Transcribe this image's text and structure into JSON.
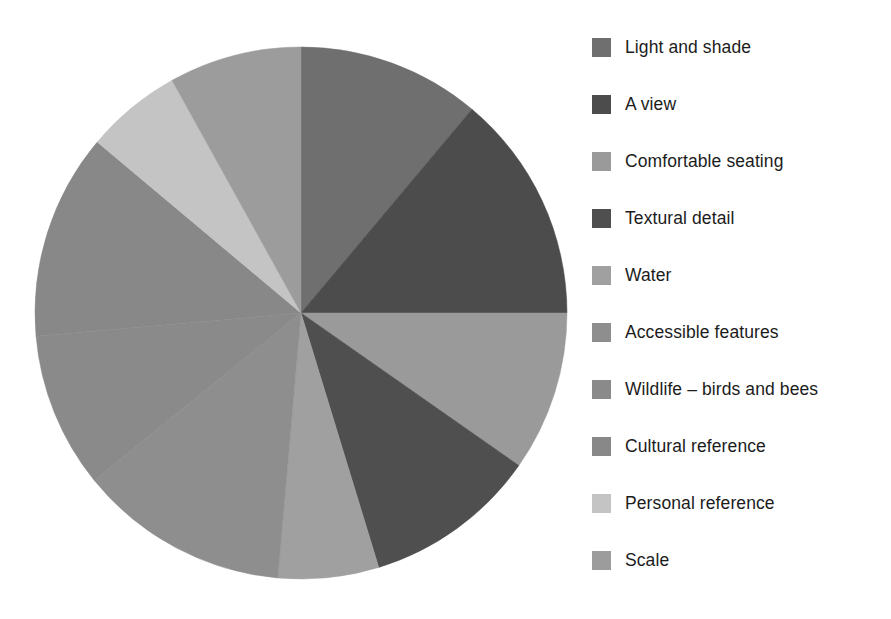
{
  "chart_data": {
    "type": "pie",
    "title": "",
    "subtitle": "",
    "xlabel": "",
    "ylabel": "",
    "legend_position": "right",
    "grid": false,
    "start_angle_deg": 0,
    "direction": "clockwise",
    "categories": [
      "Light and shade",
      "A view",
      "Comfortable seating",
      "Textural detail",
      "Water",
      "Accessible features",
      "Wildlife – birds and bees",
      "Cultural reference",
      "Personal reference",
      "Scale"
    ],
    "values": [
      11.1,
      13.9,
      9.7,
      10.6,
      6.1,
      12.8,
      9.4,
      12.5,
      5.8,
      8.1
    ],
    "angles_deg": [
      40,
      50,
      35,
      38,
      22,
      46,
      34,
      45,
      21,
      29
    ],
    "colors": [
      "#6f6f6f",
      "#4c4c4c",
      "#9a9a9a",
      "#4f4f4f",
      "#a0a0a0",
      "#8e8e8e",
      "#8a8a8a",
      "#888888",
      "#c4c4c4",
      "#9c9c9c"
    ],
    "geometry": {
      "cx": 301,
      "cy": 313,
      "r": 266
    }
  },
  "legend": {
    "items": [
      {
        "label": "Light and shade",
        "color": "#6f6f6f",
        "swatch_name": "legend-swatch-light-and-shade"
      },
      {
        "label": "A view",
        "color": "#4c4c4c",
        "swatch_name": "legend-swatch-a-view"
      },
      {
        "label": "Comfortable seating",
        "color": "#9a9a9a",
        "swatch_name": "legend-swatch-comfortable-seating"
      },
      {
        "label": "Textural detail",
        "color": "#4f4f4f",
        "swatch_name": "legend-swatch-textural-detail"
      },
      {
        "label": "Water",
        "color": "#a0a0a0",
        "swatch_name": "legend-swatch-water"
      },
      {
        "label": "Accessible features",
        "color": "#8e8e8e",
        "swatch_name": "legend-swatch-accessible-features"
      },
      {
        "label": "Wildlife – birds and bees",
        "color": "#8a8a8a",
        "swatch_name": "legend-swatch-wildlife"
      },
      {
        "label": "Cultural reference",
        "color": "#888888",
        "swatch_name": "legend-swatch-cultural-reference"
      },
      {
        "label": "Personal reference",
        "color": "#c4c4c4",
        "swatch_name": "legend-swatch-personal-reference"
      },
      {
        "label": "Scale",
        "color": "#9c9c9c",
        "swatch_name": "legend-swatch-scale"
      }
    ]
  }
}
